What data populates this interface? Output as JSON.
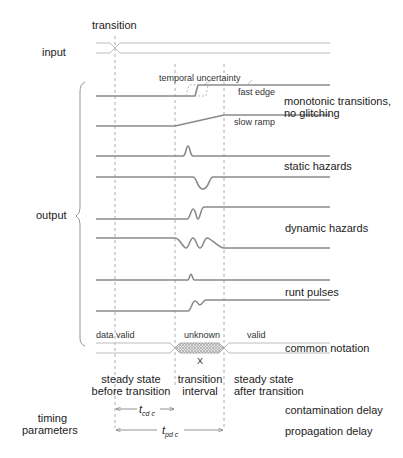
{
  "labels": {
    "transition": "transition",
    "input": "input",
    "output": "output",
    "temporal_uncertainty": "temporal uncertainty",
    "fast_edge": "fast edge",
    "slow_ramp": "slow ramp",
    "monotonic_1": "monotonic transitions,",
    "monotonic_2": "no glitching",
    "static_hazards": "static hazards",
    "dynamic_hazards": "dynamic hazards",
    "runt_pulses": "runt pulses",
    "data_valid": "data valid",
    "unknown": "unknown",
    "valid": "valid",
    "x_symbol": "X",
    "common_notation": "common notation",
    "steady_before_1": "steady state",
    "steady_before_2": "before transition",
    "transition_interval_1": "transition",
    "transition_interval_2": "interval",
    "steady_after_1": "steady state",
    "steady_after_2": "after transition",
    "timing_1": "timing",
    "timing_2": "parameters",
    "tcd": "t",
    "tcd_sub": "cd c",
    "tpd": "t",
    "tpd_sub": "pd c",
    "contamination_delay": "contamination delay",
    "propagation_delay": "propagation delay"
  },
  "colors": {
    "signal": "#8a8a8a",
    "bus": "#bdbdbd",
    "dashed": "#9a9a9a",
    "hatch": "#b8b8b8",
    "text": "#222222"
  },
  "markers": {
    "input_transition_x": 115,
    "contamination_x": 175,
    "propagation_x": 224
  }
}
